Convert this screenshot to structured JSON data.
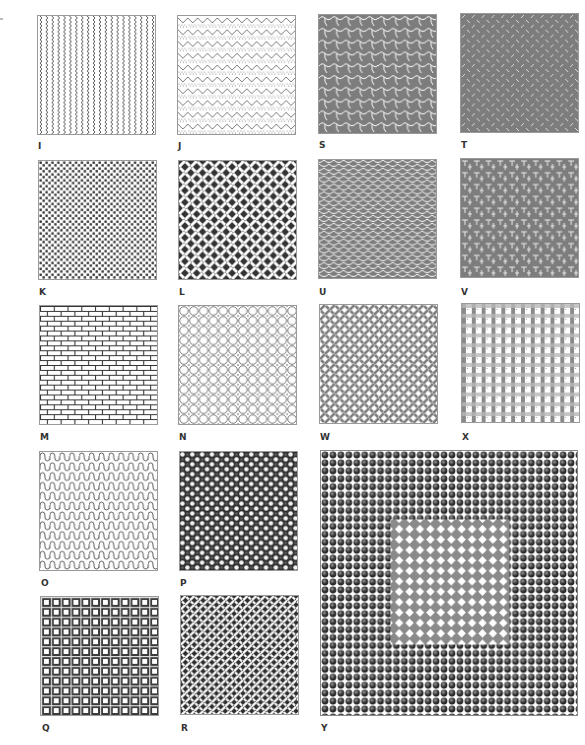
{
  "swatches": [
    {
      "label": "I",
      "pattern": "vertical zigzag wavy lines",
      "tone": "black-on-white"
    },
    {
      "label": "J",
      "pattern": "horizontal zigzag rows with dotted lines",
      "tone": "black-on-white"
    },
    {
      "label": "S",
      "pattern": "diagonal interlocking scale tiles",
      "tone": "gray"
    },
    {
      "label": "T",
      "pattern": "diamond plate diagonal dashes",
      "tone": "gray"
    },
    {
      "label": "K",
      "pattern": "staggered small squares",
      "tone": "black-on-white"
    },
    {
      "label": "L",
      "pattern": "basket weave diagonal",
      "tone": "black-on-white"
    },
    {
      "label": "U",
      "pattern": "fish scales",
      "tone": "gray"
    },
    {
      "label": "V",
      "pattern": "interlocking T weave grid",
      "tone": "gray"
    },
    {
      "label": "M",
      "pattern": "running bond brick",
      "tone": "black-on-white"
    },
    {
      "label": "N",
      "pattern": "overlapping circles lattice",
      "tone": "black-on-white"
    },
    {
      "label": "W",
      "pattern": "diagonal herringbone weave",
      "tone": "gray"
    },
    {
      "label": "X",
      "pattern": "gingham plaid",
      "tone": "gray"
    },
    {
      "label": "O",
      "pattern": "horizontal wavy bumps",
      "tone": "black-on-white"
    },
    {
      "label": "P",
      "pattern": "checker of circles",
      "tone": "black"
    },
    {
      "label": "Q",
      "pattern": "grid of hollow squares",
      "tone": "black"
    },
    {
      "label": "R",
      "pattern": "dense diagonal basket weave",
      "tone": "black"
    },
    {
      "label": "Y",
      "pattern": "spheres field with inset diamond-dot square",
      "tone": "black-and-gray"
    }
  ],
  "colors": {
    "ink": "#3a3a3a",
    "gray": "#7d7d7d",
    "paper": "#ffffff"
  }
}
